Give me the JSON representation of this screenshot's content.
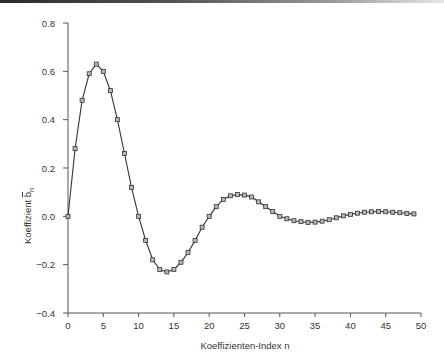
{
  "chart_data": {
    "type": "line",
    "title": "",
    "xlabel": "Koeffizienten-Index n",
    "ylabel": "Koeffizient b̄ₙ",
    "ylabel_parts": {
      "text": "Koeffizient ",
      "symbol": "b",
      "subscript": "n",
      "overline": true
    },
    "xlim": [
      0,
      50
    ],
    "ylim": [
      -0.4,
      0.8
    ],
    "xticks": [
      0,
      5,
      10,
      15,
      20,
      25,
      30,
      35,
      40,
      45,
      50
    ],
    "xtick_labels": [
      "0",
      "5",
      "10",
      "15",
      "20",
      "25",
      "30",
      "35",
      "40",
      "45",
      "50"
    ],
    "yticks": [
      0.8,
      0.6,
      0.4,
      0.2,
      0.0,
      -0.2,
      -0.4
    ],
    "ytick_labels": [
      "0.8",
      "0.6",
      "0.4",
      "0.2",
      "0.0",
      "−0.2",
      "−0.4"
    ],
    "grid": false,
    "legend": null,
    "marker": "square",
    "series": [
      {
        "name": "b̄ₙ",
        "x": [
          0,
          1,
          2,
          3,
          4,
          5,
          6,
          7,
          8,
          9,
          10,
          11,
          12,
          13,
          14,
          15,
          16,
          17,
          18,
          19,
          20,
          21,
          22,
          23,
          24,
          25,
          26,
          27,
          28,
          29,
          30,
          31,
          32,
          33,
          34,
          35,
          36,
          37,
          38,
          39,
          40,
          41,
          42,
          43,
          44,
          45,
          46,
          47,
          48,
          49
        ],
        "values": [
          0.0,
          0.28,
          0.48,
          0.59,
          0.63,
          0.6,
          0.52,
          0.4,
          0.26,
          0.12,
          0.0,
          -0.1,
          -0.18,
          -0.22,
          -0.23,
          -0.22,
          -0.19,
          -0.15,
          -0.1,
          -0.045,
          0.0,
          0.04,
          0.07,
          0.085,
          0.09,
          0.088,
          0.08,
          0.06,
          0.04,
          0.02,
          0.0,
          -0.01,
          -0.018,
          -0.022,
          -0.025,
          -0.024,
          -0.02,
          -0.014,
          -0.006,
          0.002,
          0.008,
          0.013,
          0.017,
          0.019,
          0.02,
          0.019,
          0.017,
          0.015,
          0.012,
          0.01
        ]
      }
    ]
  },
  "colors": {
    "line": "#333333",
    "marker_fill": "#b8b8b8",
    "axis": "#555555"
  }
}
